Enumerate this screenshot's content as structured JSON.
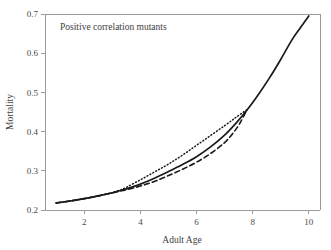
{
  "chart_data": {
    "type": "line",
    "title": "Positive correlation mutants",
    "xlabel": "Adult Age",
    "ylabel": "Mortality",
    "xlim": [
      0.6,
      10.4
    ],
    "ylim": [
      0.2,
      0.7
    ],
    "xticks": [
      2,
      4,
      6,
      8,
      10
    ],
    "xtick_labels": [
      "2",
      "4",
      "6",
      "8",
      "10"
    ],
    "yticks": [
      0.2,
      0.3,
      0.4,
      0.5,
      0.6,
      0.7
    ],
    "ytick_labels": [
      "0.2",
      "0.3",
      "0.4",
      "0.5",
      "0.6",
      "0.7"
    ],
    "grid": false,
    "legend": "none",
    "line_color": "#1a1a1a",
    "frame_color": "#9a9a9a",
    "series": [
      {
        "name": "wild-type",
        "style": "solid",
        "x": [
          1.0,
          1.5,
          2.0,
          2.5,
          3.0,
          3.25,
          3.5,
          4.0,
          4.5,
          5.0,
          5.5,
          6.0,
          6.5,
          7.0,
          7.4,
          7.8,
          8.2,
          8.6,
          9.0,
          9.4,
          9.7,
          10.0
        ],
        "y": [
          0.218,
          0.223,
          0.229,
          0.236,
          0.244,
          0.249,
          0.254,
          0.266,
          0.281,
          0.298,
          0.316,
          0.336,
          0.361,
          0.391,
          0.421,
          0.455,
          0.494,
          0.537,
          0.584,
          0.634,
          0.665,
          0.695
        ]
      },
      {
        "name": "mutant-dotted",
        "style": "dotted",
        "x": [
          1.0,
          1.5,
          2.0,
          2.5,
          3.0,
          3.25,
          3.5,
          4.0,
          4.5,
          5.0,
          5.5,
          6.0,
          6.5,
          7.0,
          7.4,
          7.8
        ],
        "y": [
          0.218,
          0.223,
          0.229,
          0.236,
          0.244,
          0.25,
          0.258,
          0.277,
          0.297,
          0.317,
          0.34,
          0.365,
          0.39,
          0.415,
          0.436,
          0.456
        ]
      },
      {
        "name": "mutant-dashed",
        "style": "dashed",
        "x": [
          1.0,
          1.5,
          2.0,
          2.5,
          3.0,
          3.25,
          3.5,
          4.0,
          4.5,
          5.0,
          5.5,
          6.0,
          6.5,
          7.0,
          7.3,
          7.55,
          7.8
        ],
        "y": [
          0.218,
          0.223,
          0.229,
          0.236,
          0.244,
          0.248,
          0.252,
          0.261,
          0.273,
          0.288,
          0.304,
          0.322,
          0.344,
          0.372,
          0.396,
          0.422,
          0.456
        ]
      }
    ]
  }
}
